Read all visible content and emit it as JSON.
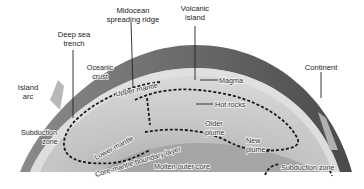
{
  "diagram": {
    "colors": {
      "background": "#ffffff",
      "crust_dark": "#5a5a5a",
      "crust_mid": "#7a7a7a",
      "upper_mantle": "#cfcfcf",
      "lower_mantle": "#bdbdbd",
      "outer_core": "#a8a8a8",
      "arrows": "#1a1a1a"
    },
    "labels": {
      "deep_sea_trench": [
        "Deep sea",
        "trench"
      ],
      "midocean_ridge": [
        "Midocean",
        "spreading ridge"
      ],
      "volcanic_island": [
        "Volcanic",
        "island"
      ],
      "oceanic_crust": [
        "Oceanic",
        "crust"
      ],
      "island_arc": [
        "Island",
        "arc"
      ],
      "magma": "Magma",
      "continent": "Continent",
      "upper_mantle": "Upper mantle",
      "hot_rocks": "Hot rocks",
      "older_plume": [
        "Older",
        "plume"
      ],
      "new_plume": [
        "New",
        "plume"
      ],
      "subduction_zone_left": [
        "Subduction",
        "zone"
      ],
      "lower_mantle": "Lower mantle",
      "core_mantle_boundary": "Core-mantle boundary layer",
      "molten_outer_core": "Molten outer core",
      "subduction_zone_right": "Subduction zone"
    }
  }
}
